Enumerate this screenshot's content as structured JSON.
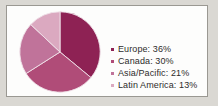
{
  "figure": {
    "background_color": "#fdfdfc",
    "frame_border_color": "#9a9892",
    "page_background_color": "#d9d7d2"
  },
  "chart_data": {
    "type": "pie",
    "title": "",
    "subtitle": "",
    "xlabel": "",
    "ylabel": "",
    "grid": false,
    "legend_position": "right",
    "start_angle_deg": 0,
    "direction": "clockwise",
    "categories": [
      "Europe",
      "Canada",
      "Asia/Pacific",
      "Latin America"
    ],
    "values": [
      36,
      30,
      21,
      13
    ],
    "value_unit": "%",
    "colors": [
      "#8e2254",
      "#b04c78",
      "#c0739a",
      "#dba9c0"
    ],
    "slice_edge_color": "#efe2e9",
    "labels": [
      "Europe: 36%",
      "Canada: 30%",
      "Asia/Pacific: 21%",
      "Latin America: 13%"
    ],
    "slices": [
      {
        "name": "Europe",
        "value": 36,
        "label": "Europe: 36%",
        "color": "#8e2254"
      },
      {
        "name": "Canada",
        "value": 30,
        "label": "Canada: 30%",
        "color": "#b04c78"
      },
      {
        "name": "Asia/Pacific",
        "value": 21,
        "label": "Asia/Pacific: 21%",
        "color": "#c0739a"
      },
      {
        "name": "Latin America",
        "value": 13,
        "label": "Latin America: 13%",
        "color": "#dba9c0"
      }
    ]
  },
  "legend": {
    "items": [
      {
        "label": "Europe: 36%",
        "marker_color": "#8e2254"
      },
      {
        "label": "Canada: 30%",
        "marker_color": "#b04c78"
      },
      {
        "label": "Asia/Pacific: 21%",
        "marker_color": "#c0739a"
      },
      {
        "label": "Latin America: 13%",
        "marker_color": "#dba9c0"
      }
    ],
    "text_color": "#2e2c2b"
  }
}
